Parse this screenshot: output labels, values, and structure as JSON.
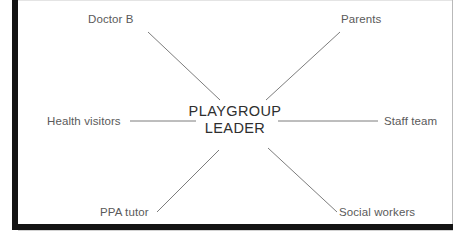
{
  "document": {
    "type": "spider-diagram",
    "title_visible": false
  },
  "diagram": {
    "center": {
      "line1": "PLAYGROUP",
      "line2": "LEADER"
    },
    "nodes": [
      {
        "id": "doctor-b",
        "label": "Doctor B",
        "position": "top-left"
      },
      {
        "id": "parents",
        "label": "Parents",
        "position": "top-right"
      },
      {
        "id": "health-visitors",
        "label": "Health visitors",
        "position": "middle-left"
      },
      {
        "id": "staff-team",
        "label": "Staff team",
        "position": "middle-right"
      },
      {
        "id": "ppa-tutor",
        "label": "PPA tutor",
        "position": "bottom-left"
      },
      {
        "id": "social-workers",
        "label": "Social workers",
        "position": "bottom-right"
      }
    ],
    "connectors": [
      {
        "from": "doctor-b",
        "to": "center",
        "x1": 148,
        "y1": 32,
        "x2": 220,
        "y2": 100
      },
      {
        "from": "parents",
        "to": "center",
        "x1": 340,
        "y1": 32,
        "x2": 266,
        "y2": 100
      },
      {
        "from": "health-visitors",
        "to": "center",
        "x1": 130,
        "y1": 121,
        "x2": 196,
        "y2": 121
      },
      {
        "from": "staff-team",
        "to": "center",
        "x1": 278,
        "y1": 121,
        "x2": 378,
        "y2": 121
      },
      {
        "from": "ppa-tutor",
        "to": "center",
        "x1": 157,
        "y1": 212,
        "x2": 219,
        "y2": 150
      },
      {
        "from": "social-workers",
        "to": "center",
        "x1": 337,
        "y1": 212,
        "x2": 268,
        "y2": 148
      }
    ],
    "colors": {
      "line": "#7d7d7d",
      "label_text": "#5a5a5a",
      "center_text": "#2e2e2e",
      "scan_border": "#141414",
      "page_background": "#ffffff"
    }
  }
}
